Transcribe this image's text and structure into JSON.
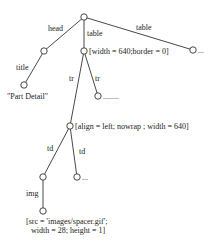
{
  "diagram": {
    "type": "tree",
    "nodes": [
      {
        "id": "root",
        "x": 84,
        "y": 17,
        "annotation": ""
      },
      {
        "id": "head",
        "x": 44,
        "y": 51,
        "annotation": ""
      },
      {
        "id": "table1",
        "x": 84,
        "y": 51,
        "annotation": "[width = 640;border = 0]"
      },
      {
        "id": "table2",
        "x": 193,
        "y": 50,
        "annotation": "..."
      },
      {
        "id": "title",
        "x": 24,
        "y": 85,
        "annotation": "\"Part Detail\""
      },
      {
        "id": "tr2",
        "x": 98,
        "y": 96,
        "annotation": "........"
      },
      {
        "id": "tr1",
        "x": 70,
        "y": 126,
        "annotation": "[align = left; nowrap ; width = 640]"
      },
      {
        "id": "td1",
        "x": 43,
        "y": 177,
        "annotation": ""
      },
      {
        "id": "td2",
        "x": 77,
        "y": 177,
        "annotation": "..."
      },
      {
        "id": "img",
        "x": 43,
        "y": 211,
        "annotation_line1": "[src = 'images/spacer.gif';",
        "annotation_line2": "width = 28; height  = 1]"
      }
    ],
    "edges": [
      {
        "from": "root",
        "to": "head",
        "label": "head"
      },
      {
        "from": "root",
        "to": "table1",
        "label": "table"
      },
      {
        "from": "root",
        "to": "table2",
        "label": "table"
      },
      {
        "from": "head",
        "to": "title",
        "label": "title"
      },
      {
        "from": "table1",
        "to": "tr1",
        "label": "tr"
      },
      {
        "from": "table1",
        "to": "tr2",
        "label": "tr"
      },
      {
        "from": "tr1",
        "to": "td1",
        "label": "td"
      },
      {
        "from": "tr1",
        "to": "td2",
        "label": "td"
      },
      {
        "from": "td1",
        "to": "img",
        "label": "img"
      }
    ]
  }
}
